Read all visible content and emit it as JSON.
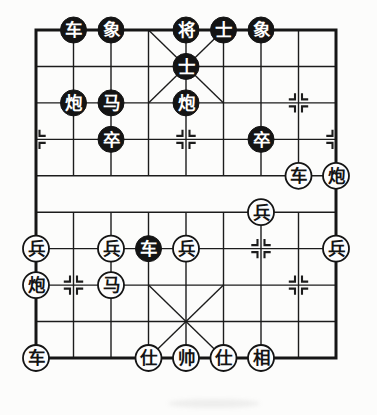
{
  "board": {
    "game": "xiangqi",
    "files": 9,
    "ranks": 10,
    "colors": {
      "line": "#1c1c1c",
      "border": "#161616",
      "black_piece_fill": "#141414",
      "black_piece_text": "#ffffff",
      "white_piece_fill": "#fdfdfd",
      "white_piece_stroke": "#141414",
      "white_piece_text": "#141414",
      "background": "#fcfcfb"
    },
    "pieces": [
      {
        "name": "black-chariot",
        "label": "车",
        "side": "black",
        "file": 1,
        "rank": 0
      },
      {
        "name": "black-elephant",
        "label": "象",
        "side": "black",
        "file": 2,
        "rank": 0
      },
      {
        "name": "black-general",
        "label": "将",
        "side": "black",
        "file": 4,
        "rank": 0
      },
      {
        "name": "black-advisor",
        "label": "士",
        "side": "black",
        "file": 5,
        "rank": 0
      },
      {
        "name": "black-elephant",
        "label": "象",
        "side": "black",
        "file": 6,
        "rank": 0
      },
      {
        "name": "black-advisor",
        "label": "士",
        "side": "black",
        "file": 4,
        "rank": 1
      },
      {
        "name": "black-cannon",
        "label": "炮",
        "side": "black",
        "file": 1,
        "rank": 2
      },
      {
        "name": "black-horse",
        "label": "马",
        "side": "black",
        "file": 2,
        "rank": 2
      },
      {
        "name": "black-cannon",
        "label": "炮",
        "side": "black",
        "file": 4,
        "rank": 2
      },
      {
        "name": "black-soldier",
        "label": "卒",
        "side": "black",
        "file": 2,
        "rank": 3
      },
      {
        "name": "black-soldier",
        "label": "卒",
        "side": "black",
        "file": 6,
        "rank": 3
      },
      {
        "name": "black-chariot",
        "label": "车",
        "side": "black",
        "file": 3,
        "rank": 6
      },
      {
        "name": "red-chariot",
        "label": "车",
        "side": "white",
        "file": 7,
        "rank": 4
      },
      {
        "name": "red-cannon",
        "label": "炮",
        "side": "white",
        "file": 8,
        "rank": 4
      },
      {
        "name": "red-soldier",
        "label": "兵",
        "side": "white",
        "file": 6,
        "rank": 5
      },
      {
        "name": "red-soldier",
        "label": "兵",
        "side": "white",
        "file": 0,
        "rank": 6
      },
      {
        "name": "red-soldier",
        "label": "兵",
        "side": "white",
        "file": 2,
        "rank": 6
      },
      {
        "name": "red-soldier",
        "label": "兵",
        "side": "white",
        "file": 4,
        "rank": 6
      },
      {
        "name": "red-soldier",
        "label": "兵",
        "side": "white",
        "file": 8,
        "rank": 6
      },
      {
        "name": "red-cannon",
        "label": "炮",
        "side": "white",
        "file": 0,
        "rank": 7
      },
      {
        "name": "red-horse",
        "label": "马",
        "side": "white",
        "file": 2,
        "rank": 7
      },
      {
        "name": "red-chariot",
        "label": "车",
        "side": "white",
        "file": 0,
        "rank": 9
      },
      {
        "name": "red-advisor",
        "label": "仕",
        "side": "white",
        "file": 3,
        "rank": 9
      },
      {
        "name": "red-general",
        "label": "帅",
        "side": "white",
        "file": 4,
        "rank": 9
      },
      {
        "name": "red-advisor",
        "label": "仕",
        "side": "white",
        "file": 5,
        "rank": 9
      },
      {
        "name": "red-elephant",
        "label": "相",
        "side": "white",
        "file": 6,
        "rank": 9
      }
    ],
    "markers": [
      {
        "file": 7,
        "rank": 2,
        "sides": "both"
      },
      {
        "file": 0,
        "rank": 3,
        "sides": "right"
      },
      {
        "file": 4,
        "rank": 3,
        "sides": "both"
      },
      {
        "file": 8,
        "rank": 3,
        "sides": "left"
      },
      {
        "file": 6,
        "rank": 6,
        "sides": "both"
      },
      {
        "file": 1,
        "rank": 7,
        "sides": "both"
      },
      {
        "file": 7,
        "rank": 7,
        "sides": "both"
      }
    ]
  }
}
